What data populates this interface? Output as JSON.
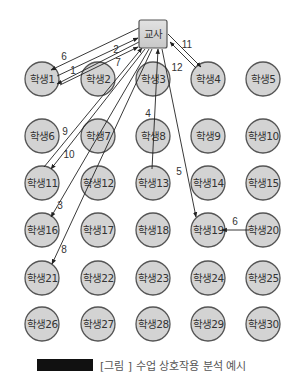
{
  "diagram": {
    "teacher": {
      "label": "교사",
      "x": 153,
      "y": 34,
      "w": 28,
      "h": 28
    },
    "colors": {
      "node_fill": "#d3d3d3",
      "node_stroke": "#555555",
      "edge": "#222222",
      "background": "#ffffff"
    },
    "students": [
      {
        "label": "학생1",
        "x": 42,
        "y": 79
      },
      {
        "label": "학생2",
        "x": 98,
        "y": 79
      },
      {
        "label": "학생3",
        "x": 153,
        "y": 79
      },
      {
        "label": "학생4",
        "x": 208,
        "y": 79
      },
      {
        "label": "학생5",
        "x": 263,
        "y": 79
      },
      {
        "label": "학생6",
        "x": 42,
        "y": 136
      },
      {
        "label": "학생7",
        "x": 98,
        "y": 136
      },
      {
        "label": "학생8",
        "x": 153,
        "y": 136
      },
      {
        "label": "학생9",
        "x": 208,
        "y": 136
      },
      {
        "label": "학생10",
        "x": 263,
        "y": 136
      },
      {
        "label": "학생11",
        "x": 42,
        "y": 183
      },
      {
        "label": "학생12",
        "x": 98,
        "y": 183
      },
      {
        "label": "학생13",
        "x": 153,
        "y": 183
      },
      {
        "label": "학생14",
        "x": 208,
        "y": 183
      },
      {
        "label": "학생15",
        "x": 263,
        "y": 183
      },
      {
        "label": "학생16",
        "x": 42,
        "y": 230
      },
      {
        "label": "학생17",
        "x": 98,
        "y": 230
      },
      {
        "label": "학생18",
        "x": 153,
        "y": 230
      },
      {
        "label": "학생19",
        "x": 208,
        "y": 230
      },
      {
        "label": "학생20",
        "x": 263,
        "y": 230
      },
      {
        "label": "학생21",
        "x": 42,
        "y": 278
      },
      {
        "label": "학생22",
        "x": 98,
        "y": 278
      },
      {
        "label": "학생23",
        "x": 153,
        "y": 278
      },
      {
        "label": "학생24",
        "x": 208,
        "y": 278
      },
      {
        "label": "학생25",
        "x": 263,
        "y": 278
      },
      {
        "label": "학생26",
        "x": 42,
        "y": 324
      },
      {
        "label": "학생27",
        "x": 98,
        "y": 324
      },
      {
        "label": "학생28",
        "x": 153,
        "y": 324
      },
      {
        "label": "학생29",
        "x": 208,
        "y": 324
      },
      {
        "label": "학생30",
        "x": 263,
        "y": 324
      }
    ],
    "edges": [
      {
        "order": "1",
        "from": "학생1",
        "to": "교사",
        "x1": 60,
        "y1": 85,
        "x2": 138,
        "y2": 47,
        "lx": 73,
        "ly": 70
      },
      {
        "order": "2",
        "from": "학생1",
        "to": "교사",
        "x1": 57,
        "y1": 76,
        "x2": 138,
        "y2": 38,
        "lx": 116,
        "ly": 49
      },
      {
        "order": "6",
        "from": "교사",
        "to": "학생1",
        "x1": 139,
        "y1": 28,
        "x2": 51,
        "y2": 70,
        "lx": 64,
        "ly": 56
      },
      {
        "order": "7",
        "from": "교사",
        "to": "학생1",
        "x1": 139,
        "y1": 42,
        "x2": 57,
        "y2": 84,
        "lx": 118,
        "ly": 62
      },
      {
        "order": "9",
        "from": "학생11",
        "to": "교사",
        "x1": 44,
        "y1": 167,
        "x2": 142,
        "y2": 48,
        "lx": 65,
        "ly": 131
      },
      {
        "order": "10",
        "from": "교사",
        "to": "학생11",
        "x1": 145,
        "y1": 49,
        "x2": 51,
        "y2": 169,
        "lx": 69,
        "ly": 154
      },
      {
        "order": "3",
        "from": "교사",
        "to": "학생16",
        "x1": 149,
        "y1": 49,
        "x2": 51,
        "y2": 217,
        "lx": 60,
        "ly": 205
      },
      {
        "order": "8",
        "from": "교사",
        "to": "학생21",
        "x1": 152,
        "y1": 49,
        "x2": 52,
        "y2": 264,
        "lx": 64,
        "ly": 249
      },
      {
        "order": "4",
        "from": "학생13",
        "to": "교사",
        "x1": 152,
        "y1": 169,
        "x2": 158,
        "y2": 49,
        "lx": 148,
        "ly": 113
      },
      {
        "order": "5",
        "from": "교사",
        "to": "학생19",
        "x1": 162,
        "y1": 49,
        "x2": 196,
        "y2": 217,
        "lx": 179,
        "ly": 171
      },
      {
        "order": "11",
        "from": "교사",
        "to": "학생4",
        "x1": 168,
        "y1": 34,
        "x2": 201,
        "y2": 67,
        "lx": 187,
        "ly": 44
      },
      {
        "order": "12",
        "from": "학생4",
        "to": "교사",
        "x1": 196,
        "y1": 68,
        "x2": 170,
        "y2": 42,
        "lx": 177,
        "ly": 67
      },
      {
        "order": "6",
        "from": "학생20",
        "to": "학생19",
        "x1": 249,
        "y1": 230,
        "x2": 222,
        "y2": 230,
        "lx": 235,
        "ly": 221
      }
    ]
  },
  "caption": {
    "text": "[그림 ] 수업 상호작용 분석 예시"
  }
}
